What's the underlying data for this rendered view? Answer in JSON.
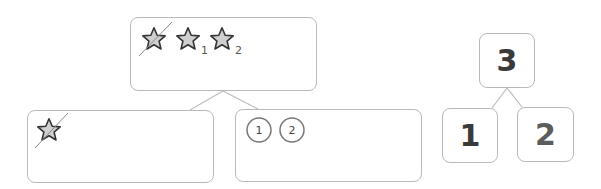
{
  "diagram": {
    "left_tree": {
      "top_box": {
        "items": [
          {
            "icon": "star-icon",
            "crossed_out": true,
            "subscript": ""
          },
          {
            "icon": "star-icon",
            "crossed_out": false,
            "subscript": "1"
          },
          {
            "icon": "star-icon",
            "crossed_out": false,
            "subscript": "2"
          }
        ]
      },
      "bottom_left_box": {
        "items": [
          {
            "icon": "star-icon",
            "crossed_out": true
          }
        ]
      },
      "bottom_right_box": {
        "circles": [
          "1",
          "2"
        ]
      }
    },
    "number_bond": {
      "whole": "3",
      "part_left": "1",
      "part_right": "2"
    },
    "colors": {
      "border": "#b9b9b9",
      "star_fill": "#cfcfcf",
      "star_stroke": "#333333",
      "line": "#bdbdbd",
      "text": "#3a3a3a"
    }
  }
}
